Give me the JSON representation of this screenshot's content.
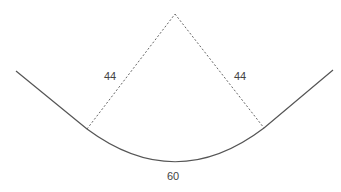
{
  "diagram": {
    "labels": {
      "left_radius": "44",
      "right_radius": "44",
      "arc_length": "60"
    },
    "colors": {
      "curve": "#555555",
      "dashed": "#666666",
      "text": "#444444"
    }
  }
}
